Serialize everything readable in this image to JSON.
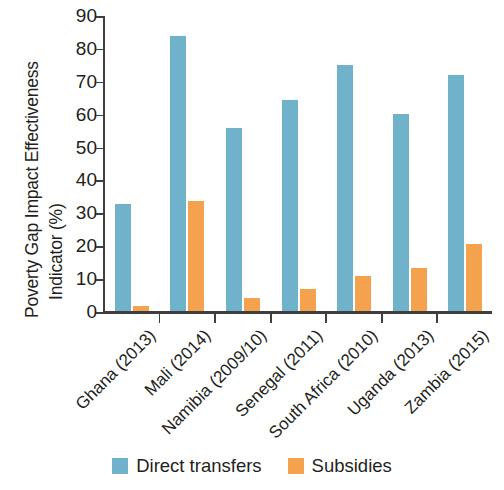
{
  "chart_data": {
    "type": "bar",
    "title": "",
    "subtitle": "",
    "xlabel": "",
    "ylabel": "Poverty Gap Impact Effectiveness Indicator (%)",
    "ylabel_lines": [
      "Poverty Gap Impact Effectiveness",
      "Indicator (%)"
    ],
    "ylim": [
      0,
      90
    ],
    "ytick_values": [
      0,
      10,
      20,
      30,
      40,
      50,
      60,
      70,
      80,
      90
    ],
    "ytick_labels": [
      "0",
      "10",
      "20",
      "30",
      "40",
      "50",
      "60",
      "70",
      "80",
      "90"
    ],
    "grid": false,
    "legend_position": "bottom-center",
    "categories": [
      "Ghana (2013)",
      "Mali (2014)",
      "Namibia (2009/10)",
      "Senegal (2011)",
      "South Africa (2010)",
      "Uganda (2013)",
      "Zambia (2015)"
    ],
    "series": [
      {
        "name": "Direct transfers",
        "color": "#6fb2c9",
        "values": [
          32.5,
          83.5,
          55.7,
          64.3,
          74.8,
          60.0,
          71.8
        ]
      },
      {
        "name": "Subsidies",
        "color": "#f4a24e",
        "values": [
          1.5,
          33.4,
          4.1,
          6.7,
          10.6,
          13.2,
          20.3
        ]
      }
    ]
  },
  "legend": {
    "items": [
      {
        "label": "Direct transfers",
        "color": "#6fb2c9"
      },
      {
        "label": "Subsidies",
        "color": "#f4a24e"
      }
    ]
  },
  "colors": {
    "direct_transfers": "#6fb2c9",
    "subsidies": "#f4a24e",
    "axis": "#3f3f3f",
    "text": "#231f20",
    "background": "#ffffff"
  }
}
